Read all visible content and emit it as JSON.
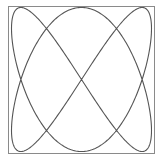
{
  "figure": {
    "type": "lissajous",
    "frame": {
      "x": 8,
      "y": 6,
      "width": 147,
      "height": 148,
      "stroke": "#8a8a8a"
    },
    "curve": {
      "x_frequency": 2,
      "y_frequency": 3,
      "phase_x": 0,
      "phase_y": 0,
      "center": [
        81.5,
        79.5
      ],
      "amplitude": [
        70,
        72
      ],
      "stroke": "#555555",
      "stroke_width": 1.1,
      "samples": 600
    },
    "self_intersections": [
      [
        47,
        30
      ],
      [
        115,
        30
      ],
      [
        22,
        79
      ],
      [
        80,
        79
      ],
      [
        138,
        79
      ],
      [
        47,
        127
      ],
      [
        115,
        127
      ]
    ]
  }
}
